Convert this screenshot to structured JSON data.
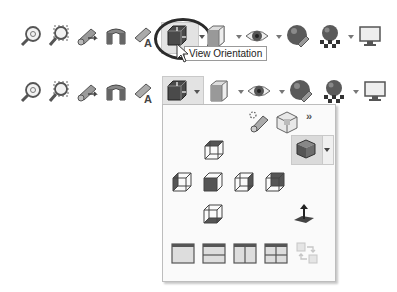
{
  "toolbar_top": {
    "items": [
      {
        "name": "zoom-to-fit",
        "icon": "zoom-fit-icon"
      },
      {
        "name": "zoom-to-area",
        "icon": "zoom-area-icon"
      },
      {
        "name": "previous-view",
        "icon": "previous-view-icon"
      },
      {
        "name": "section-view",
        "icon": "section-view-icon"
      },
      {
        "name": "dynamic-annotation-views",
        "icon": "annotation-view-icon"
      },
      {
        "name": "view-orientation",
        "icon": "view-orientation-icon",
        "highlighted": true,
        "circled": true
      },
      {
        "name": "display-style",
        "icon": "display-style-icon",
        "has_dropdown": true
      },
      {
        "name": "hide-show-items",
        "icon": "eye-icon",
        "has_dropdown": true
      },
      {
        "name": "edit-appearance",
        "icon": "appearance-sphere-icon"
      },
      {
        "name": "apply-scene",
        "icon": "scene-icon",
        "has_dropdown": true
      },
      {
        "name": "view-settings",
        "icon": "monitor-icon"
      }
    ],
    "tooltip": "View Orientation"
  },
  "toolbar_bottom": {
    "items": [
      {
        "name": "zoom-to-fit",
        "icon": "zoom-fit-icon"
      },
      {
        "name": "zoom-to-area",
        "icon": "zoom-area-icon"
      },
      {
        "name": "previous-view",
        "icon": "previous-view-icon"
      },
      {
        "name": "section-view",
        "icon": "section-view-icon"
      },
      {
        "name": "dynamic-annotation-views",
        "icon": "annotation-view-icon"
      },
      {
        "name": "view-orientation",
        "icon": "view-orientation-icon",
        "active": true,
        "has_dropdown": true
      },
      {
        "name": "display-style",
        "icon": "display-style-icon",
        "has_dropdown": true
      },
      {
        "name": "hide-show-items",
        "icon": "eye-icon",
        "has_dropdown": true
      },
      {
        "name": "edit-appearance",
        "icon": "appearance-sphere-icon"
      },
      {
        "name": "apply-scene",
        "icon": "scene-icon",
        "has_dropdown": true
      },
      {
        "name": "view-settings",
        "icon": "monitor-icon"
      }
    ]
  },
  "view_orientation_flyout": {
    "top_row": [
      {
        "name": "new-view",
        "icon": "camera-icon"
      },
      {
        "name": "view-selector",
        "icon": "view-selector-cube-icon"
      },
      {
        "name": "more",
        "label": "»"
      }
    ],
    "standard_views": [
      {
        "name": "top-view",
        "shaded_face": "top"
      },
      {
        "name": "left-view",
        "shaded_face": "left"
      },
      {
        "name": "front-view",
        "shaded_face": "front"
      },
      {
        "name": "right-view",
        "shaded_face": "right"
      },
      {
        "name": "back-view",
        "shaded_face": "back"
      },
      {
        "name": "bottom-view",
        "shaded_face": "bottom"
      }
    ],
    "isometric_button": {
      "name": "isometric-view",
      "has_dropdown": true
    },
    "normal_to": {
      "name": "normal-to",
      "icon": "normal-to-icon"
    },
    "viewports": [
      {
        "name": "single-view"
      },
      {
        "name": "two-view-horizontal"
      },
      {
        "name": "two-view-vertical"
      },
      {
        "name": "four-view"
      },
      {
        "name": "link-views",
        "disabled": true
      }
    ]
  },
  "colors": {
    "highlight_bg": "#e3e3e3",
    "panel_bg": "#fafafa",
    "panel_border": "#bdbdbd",
    "icon_dark": "#3a3a3a",
    "icon_mid": "#7a7a7a"
  }
}
